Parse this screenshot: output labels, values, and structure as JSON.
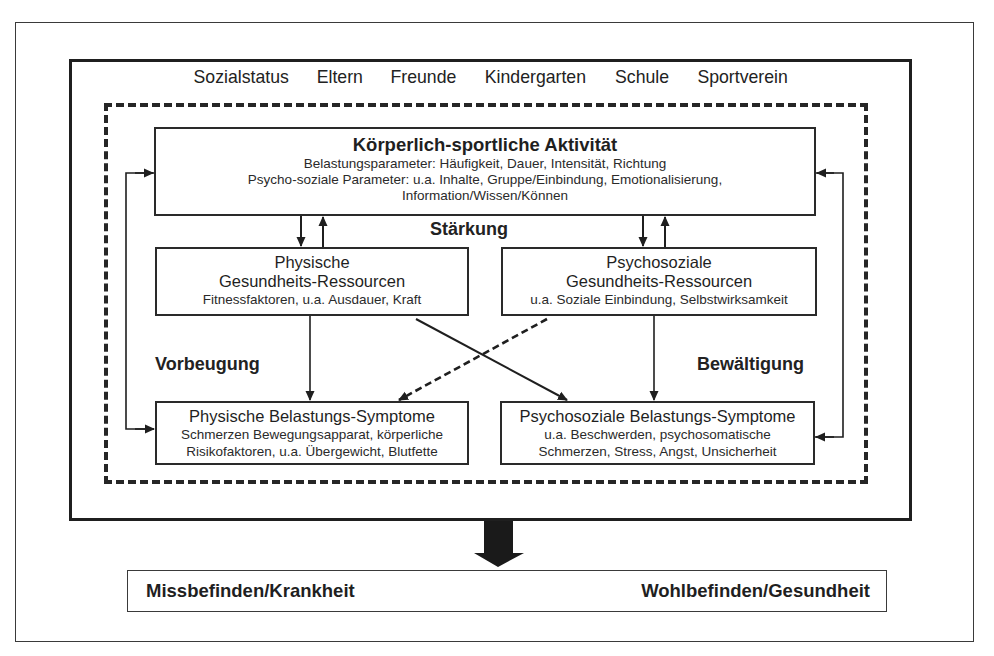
{
  "context": {
    "items": [
      "Sozialstatus",
      "Eltern",
      "Freunde",
      "Kindergarten",
      "Schule",
      "Sportverein"
    ]
  },
  "activity": {
    "title": "Körperlich-sportliche Aktivität",
    "line1": "Belastungsparameter: Häufigkeit, Dauer, Intensität, Richtung",
    "line2": "Psycho-soziale Parameter: u.a. Inhalte, Gruppe/Einbindung, Emotionalisierung,",
    "line3": "Information/Wissen/Können"
  },
  "labels": {
    "strengthening": "Stärkung",
    "prevention": "Vorbeugung",
    "coping": "Bewältigung"
  },
  "resources": {
    "physical": {
      "title_line1": "Physische",
      "title_line2": "Gesundheits-Ressourcen",
      "detail": "Fitnessfaktoren, u.a. Ausdauer, Kraft"
    },
    "psychosocial": {
      "title_line1": "Psychosoziale",
      "title_line2": "Gesundheits-Ressourcen",
      "detail": "u.a. Soziale Einbindung, Selbstwirksamkeit"
    }
  },
  "symptoms": {
    "physical": {
      "title": "Physische Belastungs-Symptome",
      "line1": "Schmerzen Bewegungsapparat, körperliche",
      "line2": "Risikofaktoren, u.a. Übergewicht, Blutfette"
    },
    "psychosocial": {
      "title": "Psychosoziale Belastungs-Symptome",
      "line1": "u.a. Beschwerden, psychosomatische",
      "line2": "Schmerzen, Stress, Angst, Unsicherheit"
    }
  },
  "outcome": {
    "left": "Missbefinden/Krankheit",
    "right": "Wohlbefinden/Gesundheit"
  },
  "colors": {
    "line": "#2a2a2a",
    "background": "#ffffff"
  }
}
